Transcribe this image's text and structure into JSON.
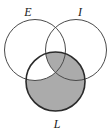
{
  "figure": {
    "type": "venn-diagram",
    "set_count": 3,
    "background_color": "#ffffff",
    "canvas": {
      "width": 112,
      "height": 133
    }
  },
  "sets": [
    {
      "id": "E",
      "label": "E",
      "position": "top-left",
      "label_x": 28,
      "label_y": 16,
      "circle": {
        "cx": 35,
        "cy": 50,
        "r": 30.5
      },
      "fill": "none",
      "fill_color": "#ffffff",
      "stroke_color": "#4a4a4a",
      "stroke_width": 1
    },
    {
      "id": "I",
      "label": "I",
      "position": "top-right",
      "label_x": 80,
      "label_y": 16,
      "circle": {
        "cx": 76,
        "cy": 50,
        "r": 30.5
      },
      "fill": "none",
      "fill_color": "#ffffff",
      "stroke_color": "#4a4a4a",
      "stroke_width": 1
    },
    {
      "id": "L",
      "label": "L",
      "position": "bottom",
      "label_x": 57,
      "label_y": 128,
      "circle": {
        "cx": 55.5,
        "cy": 81.5,
        "r": 29.5
      },
      "fill": "shaded",
      "fill_color": "#ababab",
      "stroke_color": "#2b2b2b",
      "stroke_width": 1.6
    }
  ],
  "shading": {
    "shaded_color": "#ababab",
    "unshaded_color": "#ffffff",
    "shaded_regions": [
      "L only",
      "L and I",
      "L and E and I"
    ],
    "unshaded_regions": [
      "E only",
      "I only",
      "E and I",
      "L and E"
    ],
    "description": "The L circle is shaded gray except the lens where L overlaps E outside of I, which is left white."
  },
  "labels": {
    "e": "E",
    "i": "I",
    "l": "L"
  }
}
